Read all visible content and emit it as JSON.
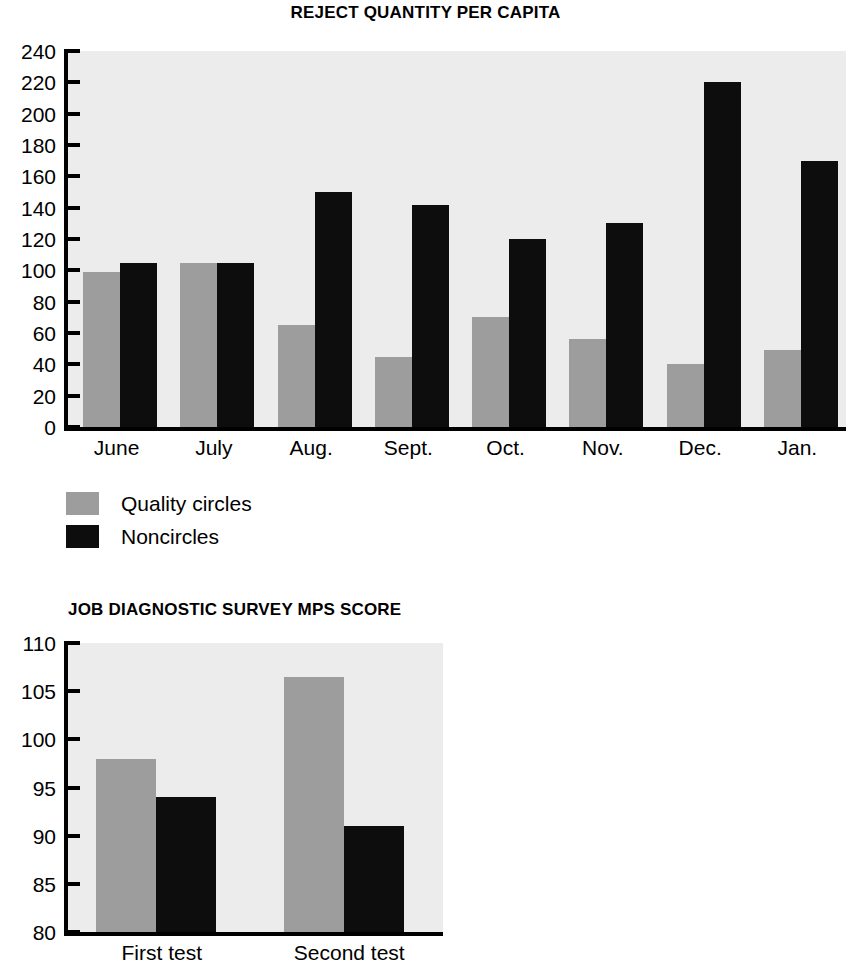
{
  "charts": [
    {
      "title": "REJECT QUANTITY PER CAPITA",
      "legend": [
        {
          "label": "Quality circles",
          "color": "#9d9d9d"
        },
        {
          "label": "Noncircles",
          "color": "#0d0d0d"
        }
      ]
    },
    {
      "title": "JOB DIAGNOSTIC SURVEY MPS SCORE"
    }
  ],
  "chart_data": [
    {
      "type": "bar",
      "title": "REJECT QUANTITY PER CAPITA",
      "xlabel": "",
      "ylabel": "",
      "categories": [
        "June",
        "July",
        "Aug.",
        "Sept.",
        "Oct.",
        "Nov.",
        "Dec.",
        "Jan."
      ],
      "series": [
        {
          "name": "Quality circles",
          "color": "#9d9d9d",
          "values": [
            99,
            105,
            65,
            45,
            70,
            56,
            40,
            49
          ]
        },
        {
          "name": "Noncircles",
          "color": "#0d0d0d",
          "values": [
            105,
            105,
            150,
            142,
            120,
            130,
            220,
            170
          ]
        }
      ],
      "ylim": [
        0,
        240
      ],
      "yticks": [
        240,
        220,
        200,
        180,
        160,
        140,
        120,
        100,
        80,
        60,
        40,
        20,
        0
      ],
      "grid": false,
      "legend_position": "below-left"
    },
    {
      "type": "bar",
      "title": "JOB DIAGNOSTIC SURVEY MPS SCORE",
      "xlabel": "",
      "ylabel": "",
      "categories": [
        "First test",
        "Second test"
      ],
      "series": [
        {
          "name": "Quality circles",
          "color": "#9d9d9d",
          "values": [
            98,
            106.5
          ]
        },
        {
          "name": "Noncircles",
          "color": "#0d0d0d",
          "values": [
            94,
            91
          ]
        }
      ],
      "ylim": [
        80,
        110
      ],
      "yticks": [
        110,
        105,
        100,
        95,
        90,
        85,
        80
      ],
      "grid": false,
      "legend_position": "none"
    }
  ]
}
